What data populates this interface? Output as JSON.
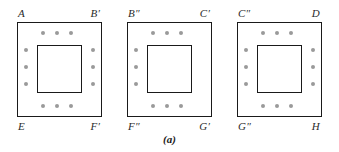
{
  "figure": {
    "caption": "(a)",
    "colors": {
      "outline": "#1a1a1a",
      "dot": "#9a9a9a",
      "label_text": "#2b2b2b",
      "background": "#ffffff"
    },
    "panels": [
      {
        "id": "panel-1",
        "corner_labels": {
          "top_left": "A",
          "top_right": "B′",
          "bottom_left": "E",
          "bottom_right": "F′"
        },
        "dot_sides": {
          "top": 3,
          "bottom": 3,
          "left": 3,
          "right": 3
        }
      },
      {
        "id": "panel-2",
        "corner_labels": {
          "top_left": "B″",
          "top_right": "C′",
          "bottom_left": "F″",
          "bottom_right": "G′"
        },
        "dot_sides": {
          "top": 3,
          "bottom": 3,
          "left": 3,
          "right": 0
        }
      },
      {
        "id": "panel-3",
        "corner_labels": {
          "top_left": "C″",
          "top_right": "D",
          "bottom_left": "G″",
          "bottom_right": "H"
        },
        "dot_sides": {
          "top": 3,
          "bottom": 3,
          "left": 3,
          "right": 3
        }
      }
    ]
  }
}
